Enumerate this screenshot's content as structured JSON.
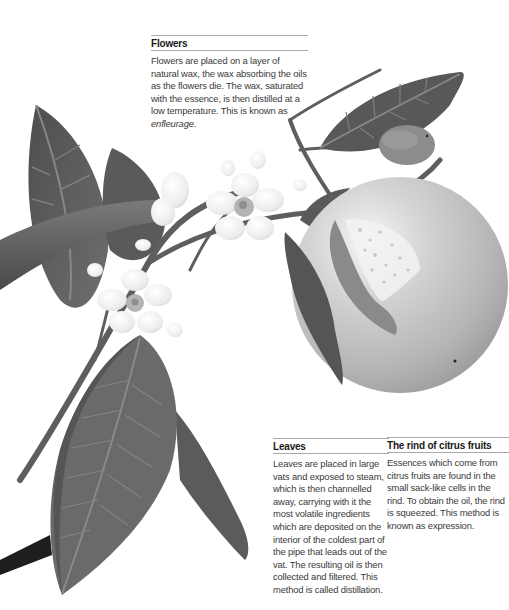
{
  "illustration": {
    "subject": "citrus branch with leaves, blossoms and fruit",
    "colors": {
      "leaf_dark": "#5a5a5a",
      "leaf_mid": "#707070",
      "leaf_vein": "#8f8f8f",
      "stem": "#5e5e5e",
      "stem_dark": "#1e1e1e",
      "fruit": "#bdbdbd",
      "fruit_highlight": "#f4f4f4",
      "flower": "#f2f2f2",
      "flower_center": "#a8a8a8",
      "rule": "#aaaaaa",
      "text": "#3a3a3a",
      "heading": "#1a1a1a"
    }
  },
  "callouts": {
    "flowers": {
      "title": "Flowers",
      "text": "Flowers are placed on a layer of natural wax, the wax absorbing the oils as the flowers die. The wax, saturated with the essence, is then distilled at a low temperature. This is known as",
      "term": "enfleurage",
      "term_suffix": "."
    },
    "leaves": {
      "title": "Leaves",
      "text": "Leaves are placed in large vats and exposed to steam, which is then channelled away, carrying with it the most volatile ingredients which are deposited on the interior of the coldest part of the pipe that leads out of the vat. The resulting oil is then collected and filtered. This method is called distillation."
    },
    "rind": {
      "title": "The rind of citrus fruits",
      "text": "Essences which come from citrus fruits are found in the small sack-like cells in the rind. To obtain the oil, the rind is squeezed. This method is known as expression."
    }
  }
}
